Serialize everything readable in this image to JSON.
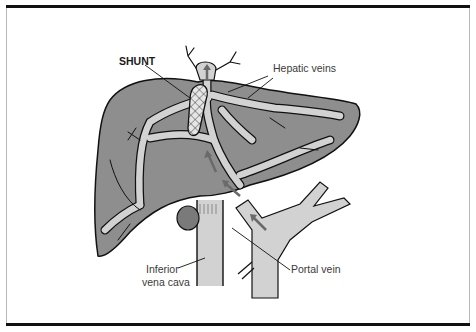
{
  "figure": {
    "type": "anatomical-illustration",
    "labels": {
      "shunt": "SHUNT",
      "hepatic_veins": "Hepatic veins",
      "inferior_vena_cava_line1": "Inferior",
      "inferior_vena_cava_line2": "vena cava",
      "portal_vein": "Portal vein"
    },
    "colors": {
      "liver": "#8e8e8e",
      "vessel": "#d2d2d2",
      "outline": "#111111",
      "arrow": "#6a6a6a",
      "frame_bar": "#111111"
    }
  }
}
